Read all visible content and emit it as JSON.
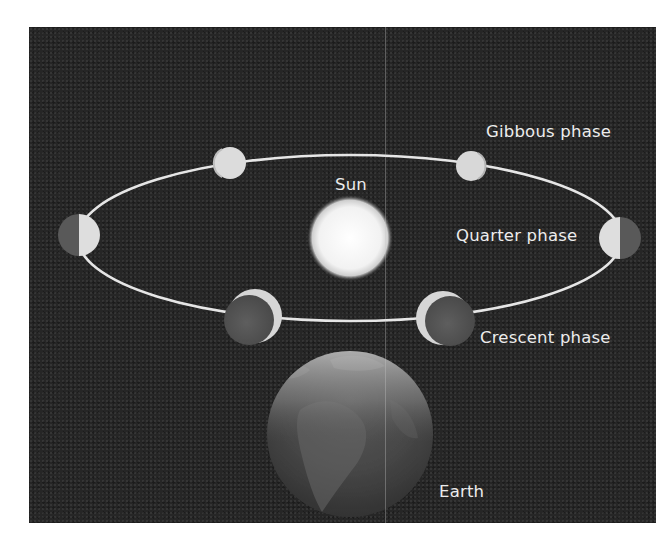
{
  "diagram": {
    "background_color": "#262626",
    "orbit": {
      "shape": "ellipse",
      "center": [
        350,
        238
      ],
      "rx": 272,
      "ry": 83,
      "stroke_color": "#e6e6e6"
    },
    "sun": {
      "label": "Sun",
      "center": [
        350,
        238
      ],
      "radius": 37,
      "color": "#f4f4f4"
    },
    "earth": {
      "label": "Earth",
      "center": [
        350,
        434
      ],
      "radius": 83
    },
    "moons": [
      {
        "id": "gibbous-left",
        "phase": "gibbous",
        "center": [
          230,
          163
        ],
        "radius": 16
      },
      {
        "id": "gibbous-right",
        "phase": "gibbous",
        "center": [
          471,
          166
        ],
        "radius": 15
      },
      {
        "id": "quarter-left",
        "phase": "quarter",
        "center": [
          79,
          235
        ],
        "radius": 21,
        "lit_side": "right"
      },
      {
        "id": "quarter-right",
        "phase": "quarter",
        "center": [
          620,
          238
        ],
        "radius": 21,
        "lit_side": "left"
      },
      {
        "id": "crescent-left",
        "phase": "crescent",
        "center": [
          255,
          316
        ],
        "radius": 27,
        "lit_side": "upper-right"
      },
      {
        "id": "crescent-right",
        "phase": "crescent",
        "center": [
          443,
          318
        ],
        "radius": 27,
        "lit_side": "left"
      }
    ],
    "labels": {
      "sun": "Sun",
      "gibbous": "Gibbous phase",
      "quarter": "Quarter phase",
      "crescent": "Crescent phase",
      "earth": "Earth"
    }
  }
}
